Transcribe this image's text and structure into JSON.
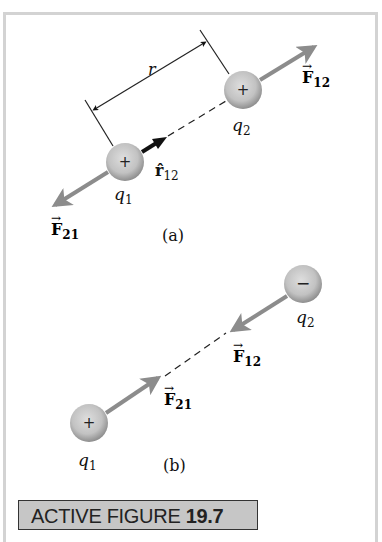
{
  "figure": {
    "label_prefix": "ACTIVE FIGURE",
    "label_number": "19.7",
    "panel_a": {
      "caption": "(a)",
      "distance_label": "r",
      "unit_vector_label": "r̂",
      "unit_vector_sub": "12",
      "charge1": {
        "name": "q",
        "sub": "1",
        "sign": "+"
      },
      "charge2": {
        "name": "q",
        "sub": "2",
        "sign": "+"
      },
      "force12": {
        "name": "F",
        "sub": "12"
      },
      "force21": {
        "name": "F",
        "sub": "21"
      }
    },
    "panel_b": {
      "caption": "(b)",
      "charge1": {
        "name": "q",
        "sub": "1",
        "sign": "+"
      },
      "charge2": {
        "name": "q",
        "sub": "2",
        "sign": "−"
      },
      "force12": {
        "name": "F",
        "sub": "12"
      },
      "force21": {
        "name": "F",
        "sub": "21"
      }
    },
    "colors": {
      "sphere_light": "#dcdcdc",
      "sphere_dark": "#8f8f8f",
      "force_arrow": "#8c8c8c",
      "frame": "#d3d3d3",
      "label_bg": "#c6c6c6"
    },
    "arrow_glyph": "→"
  }
}
